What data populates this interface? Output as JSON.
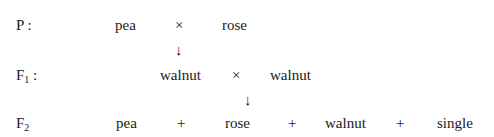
{
  "rows": [
    {
      "label": "P",
      "label_sub": "",
      "label_suffix": " :",
      "items": [
        "pea",
        "×",
        "rose"
      ]
    },
    {
      "label": "F",
      "label_sub": "1",
      "label_suffix": " :",
      "items": [
        "walnut",
        "×",
        "walnut"
      ]
    },
    {
      "label": "F",
      "label_sub": "2",
      "label_suffix": "",
      "items": [
        "pea",
        "+",
        "rose",
        "+",
        "walnut",
        "+",
        "single"
      ]
    }
  ],
  "arrows": [
    "↓",
    "↓"
  ]
}
